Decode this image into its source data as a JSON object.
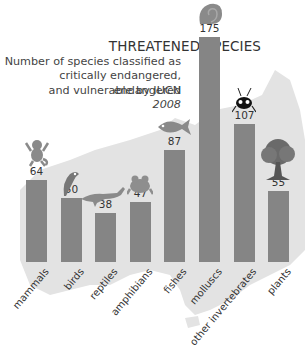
{
  "chart_data": {
    "type": "bar",
    "title": "THREATENED SPECIES",
    "subtitle": [
      "Number of species classified as",
      "critically endangered, endangered",
      "and vulnerable by IUCN"
    ],
    "year": "2008",
    "categories": [
      "mammals",
      "birds",
      "reptiles",
      "amphibians",
      "fishes",
      "molluscs",
      "other invertebrates",
      "plants"
    ],
    "values": [
      64,
      50,
      38,
      47,
      87,
      175,
      107,
      55
    ],
    "xlabel": "",
    "ylabel": "",
    "ylim": [
      0,
      175
    ],
    "grid": false,
    "bar_color": "#858585",
    "background_map_color": "#e3e3e3",
    "icons": [
      "monkey-icon",
      "parrot-icon",
      "crocodile-icon",
      "frog-icon",
      "fish-icon",
      "snail-shell-icon",
      "insect-icon",
      "tree-icon"
    ]
  }
}
